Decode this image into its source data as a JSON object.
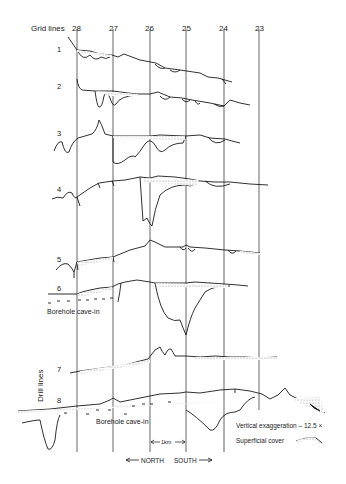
{
  "figure": {
    "grid_lines_label": "Grid lines",
    "grid_lines": [
      {
        "label": "28",
        "x": 77
      },
      {
        "label": "27",
        "x": 113
      },
      {
        "label": "26",
        "x": 150
      },
      {
        "label": "25",
        "x": 186
      },
      {
        "label": "24",
        "x": 224
      },
      {
        "label": "23",
        "x": 259
      }
    ],
    "drill_lines_label": "Drill lines",
    "profiles": [
      {
        "label": "1"
      },
      {
        "label": "2"
      },
      {
        "label": "3"
      },
      {
        "label": "4"
      },
      {
        "label": "5"
      },
      {
        "label": "6"
      },
      {
        "label": "7"
      },
      {
        "label": "8"
      }
    ],
    "annotations": {
      "borehole_cave_in_6": "Borehole cave-in",
      "borehole_cave_in_8": "Borehole cave-in",
      "scale_bar": "1km",
      "north": "NORTH",
      "south": "SOUTH"
    },
    "legend": {
      "vertical_exaggeration": "Vertical exaggeration – 12.5 ×",
      "superficial_cover": "Superficial cover"
    },
    "colors": {
      "line": "#1a1a1a",
      "stipple": "#888888",
      "background": "#ffffff"
    }
  }
}
